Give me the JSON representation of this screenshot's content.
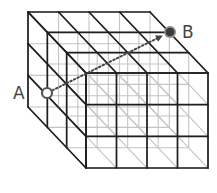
{
  "diagram": {
    "grid": {
      "columns": 4,
      "rows": 3,
      "depth": 3
    },
    "points": [
      {
        "id": "A",
        "label": "A",
        "style": "hollow",
        "position": "left face, second layer from front, 1 row down"
      },
      {
        "id": "B",
        "label": "B",
        "style": "filled",
        "position": "top face, back-right corner region"
      }
    ],
    "arrow": {
      "from": "A",
      "to": "B",
      "style": "dotted"
    },
    "colors": {
      "edge_visible": "#1e1e1e",
      "edge_hidden": "#c4c4c4",
      "point_a_stroke": "#555555",
      "point_b_fill": "#3a3a3a",
      "arrow": "#444444"
    }
  }
}
